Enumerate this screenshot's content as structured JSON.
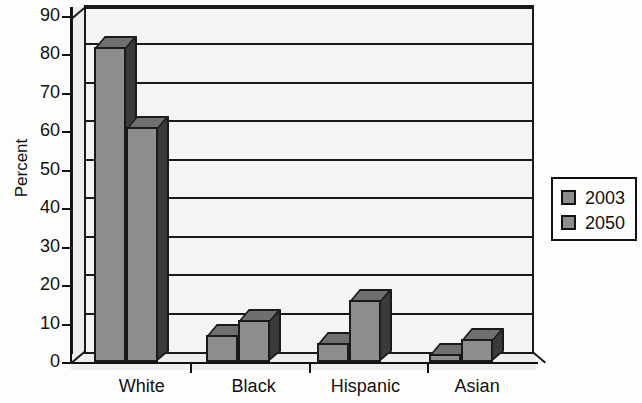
{
  "chart_data": {
    "type": "bar",
    "title": "",
    "subtitle": "",
    "xlabel": "",
    "ylabel": "Percent",
    "categories": [
      "White",
      "Black",
      "Hispanic",
      "Asian"
    ],
    "series": [
      {
        "name": "2003",
        "values": [
          82,
          7,
          5,
          2
        ]
      },
      {
        "name": "2050",
        "values": [
          61,
          11,
          16,
          6
        ]
      }
    ],
    "ylim": [
      0,
      90
    ],
    "ytick_labels": [
      "90",
      "80",
      "70",
      "60",
      "50",
      "40",
      "30",
      "20",
      "10",
      "0"
    ],
    "ytick_values": [
      90,
      80,
      70,
      60,
      50,
      40,
      30,
      20,
      10,
      0
    ],
    "grid": true,
    "grid_axis": "y",
    "legend_position": "right",
    "legend_entries": [
      "2003",
      "2050"
    ],
    "style": "3d-column",
    "colors": {
      "bar_face": "#8d8d8d",
      "bar_top": "#6f6f6f",
      "bar_side": "#3a3a3a",
      "outline": "#1a1a1a",
      "plot_background": "#f4f4f2",
      "wall_background": "#eeeeec",
      "page_background": "#fdfdfb",
      "text": "#111111"
    }
  }
}
